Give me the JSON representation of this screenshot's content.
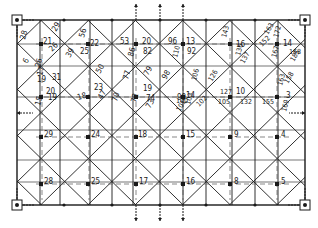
{
  "diagram": {
    "type": "structural-grid",
    "frame": {
      "x1": 17,
      "y1": 20,
      "x2": 305,
      "y2": 205
    },
    "colors": {
      "line": "#1a1a1a",
      "dash": "#555555",
      "background": "#ffffff"
    },
    "columns_x": [
      17,
      40,
      60,
      90,
      112,
      133,
      160,
      183,
      206,
      232,
      255,
      278,
      305
    ],
    "rows_y": [
      20,
      44,
      66,
      97,
      130,
      160,
      182,
      205
    ],
    "node_labels": [
      {
        "text": "28",
        "x": 25,
        "y": 40,
        "rot": -75
      },
      {
        "text": "21",
        "x": 43,
        "y": 44,
        "rot": 0
      },
      {
        "text": "26",
        "x": 52,
        "y": 52,
        "rot": -45
      },
      {
        "text": "29",
        "x": 56,
        "y": 32,
        "rot": -60
      },
      {
        "text": "56",
        "x": 84,
        "y": 38,
        "rot": -75
      },
      {
        "text": "22",
        "x": 90,
        "y": 46,
        "rot": 0
      },
      {
        "text": "25",
        "x": 80,
        "y": 54,
        "rot": 0
      },
      {
        "text": "39",
        "x": 70,
        "y": 58,
        "rot": -60
      },
      {
        "text": "53",
        "x": 120,
        "y": 44,
        "rot": 0
      },
      {
        "text": "20",
        "x": 142,
        "y": 44,
        "rot": 0
      },
      {
        "text": "82",
        "x": 143,
        "y": 54,
        "rot": 0
      },
      {
        "text": "86",
        "x": 133,
        "y": 57,
        "rot": -75
      },
      {
        "text": "96",
        "x": 168,
        "y": 44,
        "rot": 0
      },
      {
        "text": "13",
        "x": 186,
        "y": 44,
        "rot": 0
      },
      {
        "text": "92",
        "x": 187,
        "y": 54,
        "rot": 0
      },
      {
        "text": "110",
        "x": 177,
        "y": 58,
        "rot": -75
      },
      {
        "text": "143",
        "x": 226,
        "y": 38,
        "rot": -75
      },
      {
        "text": "16",
        "x": 236,
        "y": 47,
        "rot": 0
      },
      {
        "text": "136",
        "x": 240,
        "y": 56,
        "rot": -75
      },
      {
        "text": "163",
        "x": 268,
        "y": 35,
        "rot": -60
      },
      {
        "text": "172",
        "x": 278,
        "y": 38,
        "rot": -75
      },
      {
        "text": "152",
        "x": 262,
        "y": 47,
        "rot": -45
      },
      {
        "text": "14",
        "x": 283,
        "y": 46,
        "rot": 0
      },
      {
        "text": "167",
        "x": 276,
        "y": 58,
        "rot": -75
      },
      {
        "text": "168",
        "x": 289,
        "y": 54,
        "rot": 0
      },
      {
        "text": "185",
        "x": 294,
        "y": 62,
        "rot": -60
      },
      {
        "text": "6",
        "x": 27,
        "y": 64,
        "rot": -60
      },
      {
        "text": "26",
        "x": 40,
        "y": 68,
        "rot": -75
      },
      {
        "text": "19",
        "x": 37,
        "y": 82,
        "rot": 0
      },
      {
        "text": "50",
        "x": 100,
        "y": 74,
        "rot": -60
      },
      {
        "text": "17",
        "x": 42,
        "y": 76,
        "rot": -75
      },
      {
        "text": "31",
        "x": 52,
        "y": 80,
        "rot": 0
      },
      {
        "text": "20",
        "x": 46,
        "y": 94,
        "rot": 0
      },
      {
        "text": "19",
        "x": 48,
        "y": 100,
        "rot": 0
      },
      {
        "text": "15",
        "x": 40,
        "y": 106,
        "rot": -75
      },
      {
        "text": "18",
        "x": 78,
        "y": 100,
        "rot": -15
      },
      {
        "text": "23",
        "x": 94,
        "y": 90,
        "rot": 0
      },
      {
        "text": "47",
        "x": 102,
        "y": 100,
        "rot": -60
      },
      {
        "text": "70",
        "x": 117,
        "y": 102,
        "rot": -75
      },
      {
        "text": "77",
        "x": 128,
        "y": 80,
        "rot": -75
      },
      {
        "text": "79",
        "x": 148,
        "y": 76,
        "rot": -60
      },
      {
        "text": "19",
        "x": 143,
        "y": 91,
        "rot": 0
      },
      {
        "text": "72",
        "x": 136,
        "y": 103,
        "rot": -75
      },
      {
        "text": "74",
        "x": 146,
        "y": 101,
        "rot": 0
      },
      {
        "text": "73",
        "x": 150,
        "y": 109,
        "rot": -60
      },
      {
        "text": "98",
        "x": 166,
        "y": 80,
        "rot": -60
      },
      {
        "text": "99",
        "x": 177,
        "y": 100,
        "rot": 0
      },
      {
        "text": "14",
        "x": 186,
        "y": 98,
        "rot": 0
      },
      {
        "text": "100",
        "x": 176,
        "y": 103,
        "rot": 0
      },
      {
        "text": "103",
        "x": 190,
        "y": 105,
        "rot": -75
      },
      {
        "text": "101",
        "x": 180,
        "y": 112,
        "rot": -60
      },
      {
        "text": "102",
        "x": 199,
        "y": 107,
        "rot": -45
      },
      {
        "text": "106",
        "x": 196,
        "y": 81,
        "rot": -75
      },
      {
        "text": "126",
        "x": 212,
        "y": 82,
        "rot": -60
      },
      {
        "text": "127",
        "x": 220,
        "y": 94,
        "rot": 0
      },
      {
        "text": "105",
        "x": 218,
        "y": 104,
        "rot": 0
      },
      {
        "text": "10",
        "x": 236,
        "y": 94,
        "rot": 0
      },
      {
        "text": "132",
        "x": 240,
        "y": 104,
        "rot": 0
      },
      {
        "text": "137",
        "x": 244,
        "y": 64,
        "rot": -60
      },
      {
        "text": "155",
        "x": 262,
        "y": 104,
        "rot": 0
      },
      {
        "text": "163",
        "x": 282,
        "y": 86,
        "rot": -75
      },
      {
        "text": "3",
        "x": 286,
        "y": 98,
        "rot": 0
      },
      {
        "text": "158",
        "x": 288,
        "y": 84,
        "rot": -60
      },
      {
        "text": "169",
        "x": 286,
        "y": 112,
        "rot": -75
      },
      {
        "text": "29",
        "x": 44,
        "y": 137,
        "rot": 0
      },
      {
        "text": "24",
        "x": 91,
        "y": 137,
        "rot": 0
      },
      {
        "text": "18",
        "x": 138,
        "y": 137,
        "rot": 0
      },
      {
        "text": "15",
        "x": 186,
        "y": 137,
        "rot": 0
      },
      {
        "text": "9",
        "x": 234,
        "y": 137,
        "rot": 0
      },
      {
        "text": "4",
        "x": 281,
        "y": 137,
        "rot": 0
      },
      {
        "text": "28",
        "x": 44,
        "y": 184,
        "rot": 0
      },
      {
        "text": "25",
        "x": 91,
        "y": 184,
        "rot": 0
      },
      {
        "text": "17",
        "x": 139,
        "y": 184,
        "rot": 0
      },
      {
        "text": "16",
        "x": 186,
        "y": 184,
        "rot": 0
      },
      {
        "text": "8",
        "x": 234,
        "y": 184,
        "rot": 0
      },
      {
        "text": "5",
        "x": 281,
        "y": 184,
        "rot": 0
      }
    ],
    "supports": [
      {
        "name": "support-top-left",
        "x": 17,
        "y": 20
      },
      {
        "name": "support-top-right",
        "x": 305,
        "y": 20
      },
      {
        "name": "support-bottom-left",
        "x": 17,
        "y": 205
      },
      {
        "name": "support-bottom-right",
        "x": 305,
        "y": 205
      }
    ],
    "load_arrows": [
      {
        "x": 136,
        "y": 20,
        "dir": "up"
      },
      {
        "x": 160,
        "y": 20,
        "dir": "up"
      },
      {
        "x": 183,
        "y": 20,
        "dir": "up"
      },
      {
        "x": 136,
        "y": 205,
        "dir": "down"
      },
      {
        "x": 160,
        "y": 205,
        "dir": "down"
      },
      {
        "x": 183,
        "y": 205,
        "dir": "down"
      },
      {
        "x": 17,
        "y": 113,
        "dir": "left"
      },
      {
        "x": 305,
        "y": 113,
        "dir": "right"
      }
    ]
  }
}
